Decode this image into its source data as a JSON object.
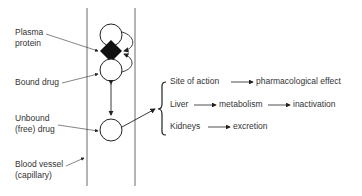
{
  "labels": {
    "plasma_protein_1": "Plasma",
    "plasma_protein_2": "protein",
    "bound_drug": "Bound drug",
    "unbound_1": "Unbound",
    "unbound_2": "(free) drug",
    "vessel_1": "Blood vessel",
    "vessel_2": "(capillary)"
  },
  "destinations": [
    {
      "site": "Site of action",
      "steps": [
        "pharmacological effect"
      ]
    },
    {
      "site": "Liver",
      "steps": [
        "metabolism",
        "inactivation"
      ]
    },
    {
      "site": "Kidneys",
      "steps": [
        "excretion"
      ]
    }
  ]
}
